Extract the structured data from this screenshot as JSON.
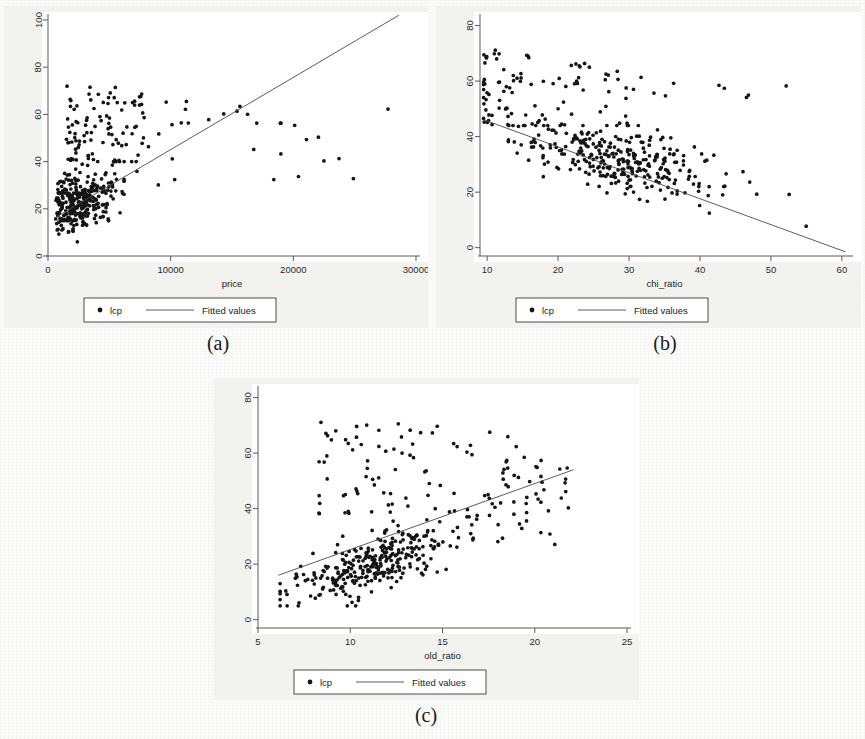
{
  "figure": {
    "background_color": "#fbfbf9",
    "panel_background_color": "#f2f2ef",
    "plot_background_color": "#ffffff",
    "marker_color": "#151515",
    "line_color": "#4a4a4a"
  },
  "captions": {
    "a": "(a)",
    "b": "(b)",
    "c": "(c)"
  },
  "legend": {
    "marker_label": "lcp",
    "line_label": "Fitted values"
  },
  "chart_data": [
    {
      "id": "panel-a",
      "type": "scatter",
      "title": "",
      "caption": "(a)",
      "xlabel": "price",
      "ylabel": "",
      "xlim": [
        0,
        30000
      ],
      "ylim": [
        0,
        100
      ],
      "xticks": [
        0,
        10000,
        20000,
        30000
      ],
      "yticks": [
        0,
        20,
        40,
        60,
        80,
        100
      ],
      "xticklabels": [
        "0",
        "10000",
        "20000",
        "30000"
      ],
      "yticklabels": [
        "0",
        "20",
        "40",
        "60",
        "80",
        "100"
      ],
      "grid": false,
      "legend": {
        "position": "below-axis",
        "entries": [
          "lcp",
          "Fitted values"
        ]
      },
      "series": [
        {
          "name": "lcp",
          "type": "scatter",
          "marker": "filled-circle",
          "n_points": 430,
          "generator": {
            "kind": "price-cluster",
            "seed": 101,
            "core": {
              "n": 300,
              "x_mode": 2600,
              "x_spread": 1600,
              "x_min": 600,
              "x_max": 6200,
              "y_center": 23,
              "y_spread": 6,
              "y_min": 6,
              "y_max": 40
            },
            "upper": {
              "n": 95,
              "x_min": 1500,
              "x_max": 8200,
              "y_min": 40,
              "y_max": 72
            },
            "tail": {
              "n": 35,
              "x_min": 7000,
              "x_max": 28500,
              "y_min": 30,
              "y_max": 66
            }
          }
        },
        {
          "name": "Fitted values",
          "type": "line",
          "points": [
            [
              500,
              16
            ],
            [
              28600,
              102
            ]
          ]
        }
      ]
    },
    {
      "id": "panel-b",
      "type": "scatter",
      "title": "",
      "caption": "(b)",
      "xlabel": "chi_ratio",
      "ylabel": "",
      "xlim": [
        9,
        61
      ],
      "ylim": [
        -3,
        82
      ],
      "xticks": [
        10,
        20,
        30,
        40,
        50,
        60
      ],
      "yticks": [
        0,
        20,
        40,
        60,
        80
      ],
      "xticklabels": [
        "10",
        "20",
        "30",
        "40",
        "50",
        "60"
      ],
      "yticklabels": [
        "0",
        "20",
        "40",
        "60",
        "80"
      ],
      "grid": false,
      "legend": {
        "position": "below-axis",
        "entries": [
          "lcp",
          "Fitted values"
        ]
      },
      "series": [
        {
          "name": "lcp",
          "type": "scatter",
          "marker": "filled-circle",
          "n_points": 430,
          "generator": {
            "kind": "chi-cluster",
            "seed": 202,
            "core": {
              "n": 300,
              "x_mode": 29,
              "x_spread": 7.5,
              "x_min": 13,
              "x_max": 48,
              "y_slope": -0.45,
              "y_intercept": 36,
              "y_spread": 6,
              "y_min": 8,
              "y_max": 44
            },
            "upper": {
              "n": 100,
              "x_min": 9.5,
              "x_max": 32,
              "y_min": 44,
              "y_max": 72
            },
            "outliers": {
              "n": 12,
              "x_min": 33,
              "x_max": 58,
              "y_min": 5,
              "y_max": 62
            }
          }
        },
        {
          "name": "Fitted values",
          "type": "line",
          "points": [
            [
              9.6,
              46
            ],
            [
              60.5,
              -1.5
            ]
          ]
        }
      ]
    },
    {
      "id": "panel-c",
      "type": "scatter",
      "title": "",
      "caption": "(c)",
      "xlabel": "old_ratio",
      "ylabel": "",
      "xlim": [
        5,
        25
      ],
      "ylim": [
        -3,
        82
      ],
      "xticks": [
        5,
        10,
        15,
        20,
        25
      ],
      "yticks": [
        0,
        20,
        40,
        60,
        80
      ],
      "xticklabels": [
        "5",
        "10",
        "15",
        "20",
        "25"
      ],
      "yticklabels": [
        "0",
        "20",
        "40",
        "60",
        "80"
      ],
      "grid": false,
      "legend": {
        "position": "below-axis",
        "entries": [
          "lcp",
          "Fitted values"
        ]
      },
      "series": [
        {
          "name": "lcp",
          "type": "scatter",
          "marker": "filled-circle",
          "n_points": 430,
          "generator": {
            "kind": "old-cluster",
            "seed": 303,
            "core": {
              "n": 300,
              "x_mode": 11.5,
              "x_spread": 2.2,
              "x_min": 6.2,
              "x_max": 18,
              "y_slope": 2.2,
              "y_intercept": -5,
              "y_spread": 5,
              "y_min": 5,
              "y_max": 40
            },
            "upper": {
              "n": 110,
              "x_min": 8.3,
              "x_max": 22,
              "y_min": 38,
              "y_max": 72
            },
            "tail": {
              "n": 20,
              "x_min": 15,
              "x_max": 22,
              "y_min": 24,
              "y_max": 55
            }
          }
        },
        {
          "name": "Fitted values",
          "type": "line",
          "points": [
            [
              6.1,
              16
            ],
            [
              22.1,
              54
            ]
          ]
        }
      ]
    }
  ]
}
